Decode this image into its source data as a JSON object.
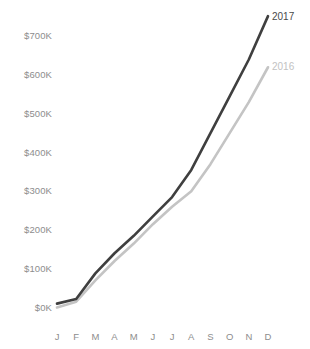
{
  "chart_data": {
    "type": "line",
    "title": "",
    "subtitle": "",
    "xlabel": "",
    "ylabel": "",
    "categories": [
      "J",
      "F",
      "M",
      "A",
      "M",
      "J",
      "J",
      "A",
      "S",
      "O",
      "N",
      "D"
    ],
    "y_tick_labels": [
      "$700K",
      "$600K",
      "$500K",
      "$400K",
      "$300K",
      "$200K",
      "$100K",
      "$0K"
    ],
    "y_tick_values": [
      700000,
      600000,
      500000,
      400000,
      300000,
      200000,
      100000,
      0
    ],
    "ylim": [
      0,
      760000
    ],
    "grid": false,
    "legend_position": "line-end-labels",
    "series": [
      {
        "name": "2017",
        "color": "#3f3f3f",
        "values": [
          10000,
          22000,
          88000,
          140000,
          185000,
          235000,
          285000,
          355000,
          450000,
          545000,
          640000,
          752000
        ]
      },
      {
        "name": "2016",
        "color": "#c4c4c4",
        "values": [
          0,
          15000,
          70000,
          120000,
          165000,
          215000,
          260000,
          300000,
          370000,
          450000,
          530000,
          620000
        ]
      }
    ],
    "annotations": [
      {
        "text": "2017",
        "series": "2017",
        "anchor_month": "D"
      },
      {
        "text": "2016",
        "series": "2016",
        "anchor_month": "D"
      }
    ]
  },
  "axes": {
    "y_labels": [
      "$700K",
      "$600K",
      "$500K",
      "$400K",
      "$300K",
      "$200K",
      "$100K",
      "$0K"
    ],
    "x_labels": [
      "J",
      "F",
      "M",
      "A",
      "M",
      "J",
      "J",
      "A",
      "S",
      "O",
      "N",
      "D"
    ],
    "tick_color": "#8d8d8d"
  },
  "legend": {
    "items": [
      {
        "label": "2017",
        "color": "#3f3f3f"
      },
      {
        "label": "2016",
        "color": "#c4c4c4"
      }
    ]
  },
  "colors": {
    "background": "#ffffff",
    "series_2017": "#3f3f3f",
    "series_2016": "#c4c4c4",
    "text": "#8d8d8d"
  }
}
